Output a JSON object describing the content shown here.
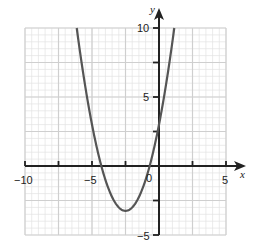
{
  "chart_data": {
    "type": "line",
    "title": "",
    "xlabel": "x",
    "ylabel": "y",
    "xlim": [
      -10,
      5
    ],
    "ylim": [
      -5,
      10
    ],
    "grid": true,
    "grid_minor_step": 0.5,
    "grid_major_step": 2.5,
    "x_ticks": [
      -10,
      -7.5,
      -5,
      -2.5,
      0,
      2.5,
      5
    ],
    "y_ticks": [
      -5,
      -2.5,
      0,
      2.5,
      5,
      7.5,
      10
    ],
    "x_tick_labels": [
      "-10",
      "-5",
      "0",
      "5"
    ],
    "y_tick_labels": [
      "-5",
      "5",
      "10"
    ],
    "series": [
      {
        "name": "parabola",
        "equation": "y = x^2 + 5x + 3",
        "color": "#555555",
        "x": [
          -6.14,
          -6,
          -5.5,
          -5,
          -4.5,
          -4.3,
          -4,
          -3.5,
          -3,
          -2.5,
          -2,
          -1.5,
          -1,
          -0.7,
          -0.5,
          0,
          0.5,
          1,
          1.14
        ],
        "y": [
          10,
          9,
          5.75,
          3,
          0.75,
          0,
          -1,
          -2.25,
          -3,
          -3.25,
          -3,
          -2.25,
          -1,
          0,
          0.75,
          3,
          5.75,
          9,
          10
        ]
      }
    ],
    "annotations": {
      "vertex": [
        -2.5,
        -3.25
      ],
      "roots": [
        -4.3,
        -0.7
      ],
      "y_intercept": 3
    }
  },
  "labels": {
    "x_axis": "x",
    "y_axis": "y",
    "x_neg10": "−10",
    "x_neg5": "−5",
    "x_zero": "0",
    "x_5": "5",
    "y_10": "10",
    "y_5": "5",
    "y_neg5": "−5"
  }
}
